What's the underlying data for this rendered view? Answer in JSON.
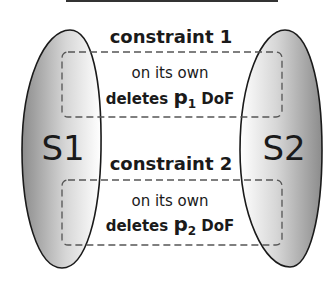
{
  "sets": [
    {
      "label": "S1"
    },
    {
      "label": "S2"
    }
  ],
  "constraints": [
    {
      "title": "constraint 1",
      "line1": "on its own",
      "line2_prefix": "deletes ",
      "param": "p",
      "sub": "1",
      "line2_suffix": " DoF"
    },
    {
      "title": "constraint 2",
      "line1": "on its own",
      "line2_prefix": "deletes ",
      "param": "p",
      "sub": "2",
      "line2_suffix": " DoF"
    }
  ],
  "colors": {
    "ink": "#1a1a1a",
    "shape_light": "#ffffff",
    "shape_dark": "#8a8a8a",
    "dash": "#555555"
  }
}
